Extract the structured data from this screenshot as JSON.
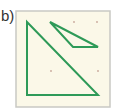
{
  "label": "b)",
  "colors": {
    "frame_fill": "#fbf8e8",
    "frame_stroke": "#c9c9c4",
    "line": "#2e9a58",
    "dot": "#c8a89a"
  },
  "frame": {
    "x": 16,
    "y": 11,
    "w": 94,
    "h": 96
  },
  "shapes": [
    {
      "name": "large-right-triangle",
      "points": [
        [
          27,
          22
        ],
        [
          27,
          95
        ],
        [
          98,
          95
        ]
      ]
    },
    {
      "name": "small-obtuse-triangle",
      "points": [
        [
          50,
          22
        ],
        [
          98,
          47
        ],
        [
          73,
          47
        ]
      ]
    }
  ],
  "dots": [
    [
      74,
      22
    ],
    [
      97,
      22
    ],
    [
      51,
      71
    ],
    [
      98,
      71
    ]
  ]
}
